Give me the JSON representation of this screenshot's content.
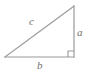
{
  "figure": {
    "kind": "right-triangle-diagram",
    "width": 90,
    "height": 72,
    "background_color": "#ffffff",
    "stroke_color": "#9a9a9a",
    "label_color": "#6f6f6f",
    "stroke_width": 1.2
  },
  "labels": {
    "leg_vertical": "a",
    "leg_horizontal": "b",
    "hypotenuse": "c"
  },
  "geometry": {
    "vertices": {
      "left": [
        5,
        57
      ],
      "bottom_right": [
        74,
        57
      ],
      "top_right": [
        74,
        6
      ]
    },
    "right_angle_marker": {
      "corner": [
        74,
        57
      ],
      "size": 6
    }
  },
  "chart_data": {
    "type": "diagram",
    "title": "",
    "shape": "right triangle",
    "annotations": [
      {
        "name": "a",
        "role": "vertical leg (opposite side)",
        "x": 80,
        "y": 32
      },
      {
        "name": "b",
        "role": "horizontal leg (adjacent side)",
        "x": 40,
        "y": 65
      },
      {
        "name": "c",
        "role": "hypotenuse",
        "x": 32,
        "y": 21
      },
      {
        "name": "right-angle",
        "role": "90 degree marker at bottom-right vertex",
        "x": 71,
        "y": 54
      }
    ]
  }
}
